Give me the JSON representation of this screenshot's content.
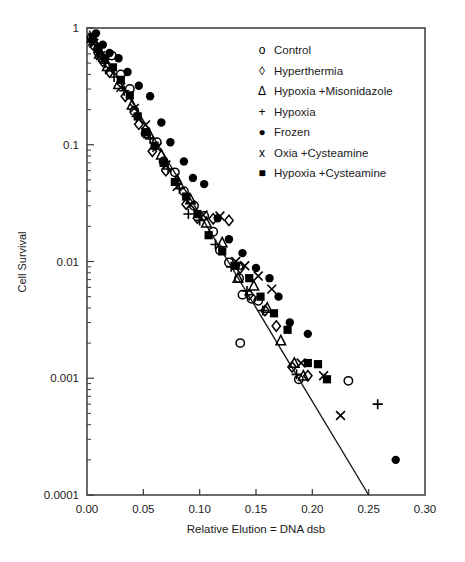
{
  "chart_data": {
    "type": "scatter",
    "title": "",
    "xlabel": "Relative Elution = DNA dsb",
    "ylabel": "Cell Survival",
    "xlim": [
      0.0,
      0.3
    ],
    "ylim": [
      0.0001,
      1
    ],
    "yscale": "log",
    "xscale": "linear",
    "grid": false,
    "legend_position": "top-right",
    "xticks": [
      "0.00",
      "0.05",
      "0.10",
      "0.15",
      "0.20",
      "0.25",
      "0.30"
    ],
    "xtick_values": [
      0.0,
      0.05,
      0.1,
      0.15,
      0.2,
      0.25,
      0.3
    ],
    "yticks": [
      "1",
      "0.1",
      "0.01",
      "0.001",
      "0.0001"
    ],
    "ytick_values": [
      1,
      0.1,
      0.01,
      0.001,
      0.0001
    ],
    "fit_line": {
      "label": "linear fit",
      "x": [
        0.002,
        0.25
      ],
      "y": [
        0.95,
        0.0001
      ]
    },
    "series": [
      {
        "name": "Control",
        "marker": "circle-open",
        "glyph": "o",
        "points": [
          [
            0.004,
            0.82
          ],
          [
            0.007,
            0.7
          ],
          [
            0.01,
            0.62
          ],
          [
            0.013,
            0.56
          ],
          [
            0.022,
            0.58
          ],
          [
            0.03,
            0.4
          ],
          [
            0.038,
            0.3
          ],
          [
            0.042,
            0.195
          ],
          [
            0.052,
            0.125
          ],
          [
            0.062,
            0.105
          ],
          [
            0.068,
            0.072
          ],
          [
            0.078,
            0.058
          ],
          [
            0.086,
            0.04
          ],
          [
            0.095,
            0.03
          ],
          [
            0.104,
            0.0245
          ],
          [
            0.112,
            0.018
          ],
          [
            0.118,
            0.0125
          ],
          [
            0.126,
            0.0098
          ],
          [
            0.135,
            0.0072
          ],
          [
            0.138,
            0.0052
          ],
          [
            0.146,
            0.0048
          ],
          [
            0.152,
            0.0046
          ],
          [
            0.136,
            0.002
          ],
          [
            0.188,
            0.00098
          ],
          [
            0.232,
            0.00095
          ]
        ]
      },
      {
        "name": "Hyperthermia",
        "marker": "diamond-open",
        "glyph": "◊",
        "points": [
          [
            0.005,
            0.8
          ],
          [
            0.009,
            0.66
          ],
          [
            0.014,
            0.52
          ],
          [
            0.02,
            0.42
          ],
          [
            0.034,
            0.26
          ],
          [
            0.046,
            0.15
          ],
          [
            0.058,
            0.088
          ],
          [
            0.07,
            0.06
          ],
          [
            0.088,
            0.031
          ],
          [
            0.098,
            0.0235
          ],
          [
            0.112,
            0.0232
          ],
          [
            0.126,
            0.0225
          ],
          [
            0.136,
            0.0088
          ],
          [
            0.144,
            0.0052
          ],
          [
            0.158,
            0.0038
          ],
          [
            0.168,
            0.0028
          ],
          [
            0.182,
            0.00125
          ],
          [
            0.196,
            0.00105
          ]
        ]
      },
      {
        "name": "Hypoxia +Misonidazole",
        "marker": "triangle-open",
        "glyph": "Δ",
        "points": [
          [
            0.006,
            0.78
          ],
          [
            0.011,
            0.6
          ],
          [
            0.018,
            0.47
          ],
          [
            0.028,
            0.33
          ],
          [
            0.04,
            0.22
          ],
          [
            0.055,
            0.125
          ],
          [
            0.066,
            0.082
          ],
          [
            0.08,
            0.05
          ],
          [
            0.092,
            0.034
          ],
          [
            0.106,
            0.0215
          ],
          [
            0.12,
            0.0145
          ],
          [
            0.134,
            0.0072
          ],
          [
            0.148,
            0.0062
          ],
          [
            0.16,
            0.004
          ],
          [
            0.172,
            0.0021
          ],
          [
            0.184,
            0.00135
          ],
          [
            0.192,
            0.00105
          ]
        ]
      },
      {
        "name": "Hypoxia",
        "marker": "plus",
        "glyph": "+",
        "points": [
          [
            0.004,
            0.76
          ],
          [
            0.01,
            0.62
          ],
          [
            0.016,
            0.5
          ],
          [
            0.024,
            0.38
          ],
          [
            0.033,
            0.29
          ],
          [
            0.044,
            0.175
          ],
          [
            0.056,
            0.112
          ],
          [
            0.072,
            0.062
          ],
          [
            0.082,
            0.042
          ],
          [
            0.09,
            0.0255
          ],
          [
            0.1,
            0.0225
          ],
          [
            0.114,
            0.014
          ],
          [
            0.128,
            0.009
          ],
          [
            0.142,
            0.0056
          ],
          [
            0.156,
            0.0038
          ],
          [
            0.186,
            0.00108
          ],
          [
            0.258,
            0.0006
          ]
        ]
      },
      {
        "name": "Frozen",
        "marker": "circle-filled",
        "glyph": "●",
        "points": [
          [
            0.008,
            0.9
          ],
          [
            0.014,
            0.72
          ],
          [
            0.02,
            0.61
          ],
          [
            0.028,
            0.55
          ],
          [
            0.036,
            0.42
          ],
          [
            0.046,
            0.32
          ],
          [
            0.056,
            0.26
          ],
          [
            0.066,
            0.155
          ],
          [
            0.074,
            0.105
          ],
          [
            0.086,
            0.072
          ],
          [
            0.094,
            0.052
          ],
          [
            0.104,
            0.046
          ],
          [
            0.116,
            0.0235
          ],
          [
            0.126,
            0.0155
          ],
          [
            0.138,
            0.0118
          ],
          [
            0.15,
            0.0088
          ],
          [
            0.162,
            0.0072
          ],
          [
            0.17,
            0.005
          ],
          [
            0.18,
            0.003
          ],
          [
            0.196,
            0.0024
          ],
          [
            0.274,
            0.0002
          ]
        ]
      },
      {
        "name": "Oxia +Cysteamine",
        "marker": "cross",
        "glyph": "x",
        "points": [
          [
            0.006,
            0.74
          ],
          [
            0.012,
            0.58
          ],
          [
            0.02,
            0.44
          ],
          [
            0.03,
            0.31
          ],
          [
            0.042,
            0.205
          ],
          [
            0.052,
            0.148
          ],
          [
            0.062,
            0.095
          ],
          [
            0.07,
            0.067
          ],
          [
            0.08,
            0.044
          ],
          [
            0.092,
            0.0305
          ],
          [
            0.103,
            0.025
          ],
          [
            0.118,
            0.0245
          ],
          [
            0.132,
            0.01
          ],
          [
            0.14,
            0.0092
          ],
          [
            0.152,
            0.0075
          ],
          [
            0.164,
            0.0058
          ],
          [
            0.19,
            0.00135
          ],
          [
            0.21,
            0.00105
          ],
          [
            0.225,
            0.00048
          ]
        ]
      },
      {
        "name": "Hypoxia +Cysteamine",
        "marker": "square-filled",
        "glyph": "■",
        "points": [
          [
            0.005,
            0.84
          ],
          [
            0.01,
            0.68
          ],
          [
            0.016,
            0.55
          ],
          [
            0.023,
            0.46
          ],
          [
            0.03,
            0.36
          ],
          [
            0.038,
            0.265
          ],
          [
            0.045,
            0.175
          ],
          [
            0.052,
            0.128
          ],
          [
            0.06,
            0.098
          ],
          [
            0.068,
            0.07
          ],
          [
            0.078,
            0.048
          ],
          [
            0.088,
            0.036
          ],
          [
            0.098,
            0.0255
          ],
          [
            0.108,
            0.0168
          ],
          [
            0.12,
            0.0122
          ],
          [
            0.132,
            0.0092
          ],
          [
            0.144,
            0.0072
          ],
          [
            0.154,
            0.005
          ],
          [
            0.166,
            0.0036
          ],
          [
            0.178,
            0.0026
          ],
          [
            0.196,
            0.00135
          ],
          [
            0.205,
            0.00132
          ],
          [
            0.213,
            0.00098
          ]
        ]
      }
    ]
  },
  "legend": {
    "items": [
      {
        "glyph": "o",
        "label": "Control"
      },
      {
        "glyph": "◊",
        "label": "Hyperthermia"
      },
      {
        "glyph": "Δ",
        "label": "Hypoxia +Misonidazole"
      },
      {
        "glyph": "+",
        "label": "Hypoxia"
      },
      {
        "glyph": "●",
        "label": "Frozen"
      },
      {
        "glyph": "x",
        "label": "Oxia +Cysteamine"
      },
      {
        "glyph": "■",
        "label": "Hypoxia +Cysteamine"
      }
    ]
  },
  "colors": {
    "marker": "#000000",
    "axis": "#3a3a3a",
    "background": "#ffffff"
  }
}
